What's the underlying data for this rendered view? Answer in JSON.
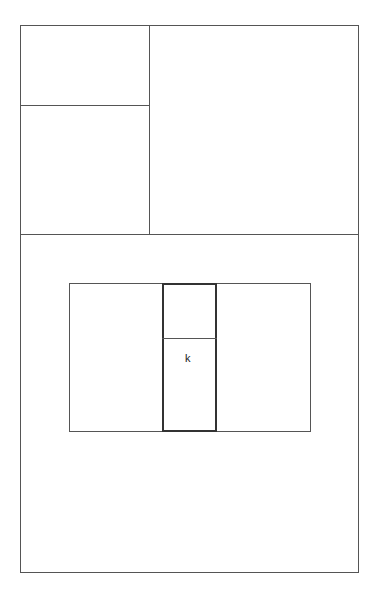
{
  "diagram": {
    "highlighted_cell": {
      "label": "k"
    }
  }
}
